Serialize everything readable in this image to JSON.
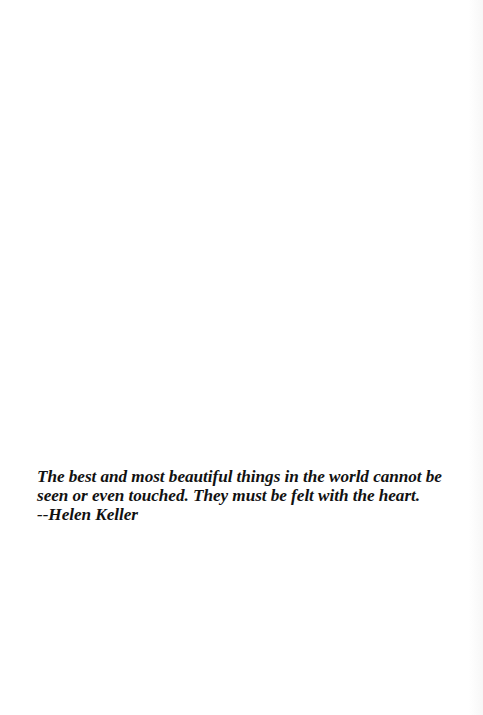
{
  "document": {
    "background_color": "#ffffff",
    "text_color": "#111111",
    "quote": {
      "lines": [
        "The best and most beautiful things in the world cannot be",
        "seen or even touched. They must be felt with the heart."
      ],
      "attribution": "--Helen Keller"
    }
  }
}
